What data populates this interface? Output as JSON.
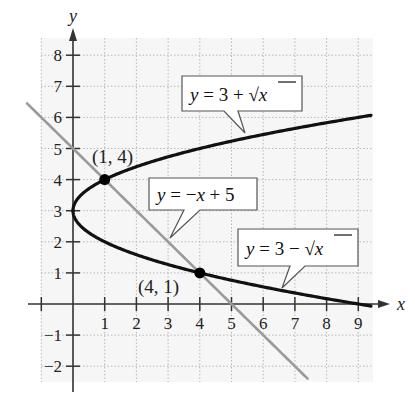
{
  "chart_data": {
    "type": "line",
    "title": "",
    "xlabel": "x",
    "ylabel": "y",
    "xlim": [
      -1,
      9.4
    ],
    "ylim": [
      -2.5,
      8.4
    ],
    "grid": true,
    "x_ticks": [
      -1,
      1,
      2,
      3,
      4,
      5,
      6,
      7,
      8,
      9
    ],
    "y_ticks": [
      -2,
      -1,
      1,
      2,
      3,
      4,
      5,
      6,
      7,
      8
    ],
    "x_tick_labels": [
      "1",
      "2",
      "3",
      "4",
      "5",
      "6",
      "7",
      "8",
      "9"
    ],
    "y_tick_labels": [
      "8",
      "7",
      "6",
      "5",
      "4",
      "3",
      "2",
      "1",
      "−1",
      "−2"
    ],
    "series": [
      {
        "name": "y = 3 + √x",
        "color": "#111111",
        "function": "3+sqrt(x)",
        "x_range": [
          0,
          9.4
        ]
      },
      {
        "name": "y = 3 − √x",
        "color": "#111111",
        "function": "3-sqrt(x)",
        "x_range": [
          0,
          9.4
        ]
      },
      {
        "name": "y = −x + 5",
        "color": "#9a9a9a",
        "function": "-x+5",
        "x_range": [
          -1.45,
          7.4
        ]
      }
    ],
    "points": [
      {
        "label": "(1, 4)",
        "x": 1,
        "y": 4
      },
      {
        "label": "(4, 1)",
        "x": 4,
        "y": 1
      }
    ],
    "annotations": [
      {
        "text_parts": [
          "y",
          " = 3 + ",
          "x"
        ],
        "text": "y = 3 + √x",
        "points_to": "upper curve"
      },
      {
        "text_parts": [
          "y",
          " = −",
          "x",
          " + 5"
        ],
        "text": "y = −x + 5",
        "points_to": "line"
      },
      {
        "text_parts": [
          "y",
          " = 3 − ",
          "x"
        ],
        "text": "y = 3 − √x",
        "points_to": "lower curve"
      }
    ]
  }
}
